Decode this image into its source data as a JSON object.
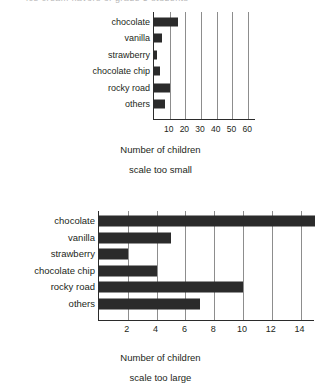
{
  "top_edge_artifact": "ice cream flavors of grade 5 students",
  "figures": [
    {
      "id": "scale-too-small",
      "xlabel": "Number of children",
      "caption": "scale too small",
      "ticks": [
        "10",
        "20",
        "30",
        "40",
        "50",
        "60"
      ]
    },
    {
      "id": "scale-too-large",
      "xlabel": "Number of children",
      "caption": "scale too large",
      "ticks": [
        "2",
        "4",
        "6",
        "8",
        "10",
        "12",
        "14"
      ]
    }
  ],
  "chart_data": [
    {
      "type": "bar",
      "orientation": "horizontal",
      "id": "scale-too-small",
      "title": "",
      "xlabel": "Number of children",
      "ylabel": "",
      "caption": "scale too small",
      "categories": [
        "chocolate",
        "vanilla",
        "strawberry",
        "chocolate chip",
        "rocky road",
        "others"
      ],
      "values": [
        15,
        5,
        2,
        4,
        10,
        7
      ],
      "xlim": [
        0,
        65
      ],
      "xticks": [
        10,
        20,
        30,
        40,
        50,
        60
      ],
      "grid": true,
      "legend": "none",
      "bar_color": "#2b2b2b"
    },
    {
      "type": "bar",
      "orientation": "horizontal",
      "id": "scale-too-large",
      "title": "",
      "xlabel": "Number of children",
      "ylabel": "",
      "caption": "scale too large",
      "categories": [
        "chocolate",
        "vanilla",
        "strawberry",
        "chocolate chip",
        "rocky road",
        "others"
      ],
      "values": [
        15,
        5,
        2,
        4,
        10,
        7
      ],
      "xlim": [
        0,
        15
      ],
      "xticks": [
        2,
        4,
        6,
        8,
        10,
        12,
        14
      ],
      "grid": true,
      "legend": "none",
      "bar_color": "#2b2b2b"
    }
  ]
}
